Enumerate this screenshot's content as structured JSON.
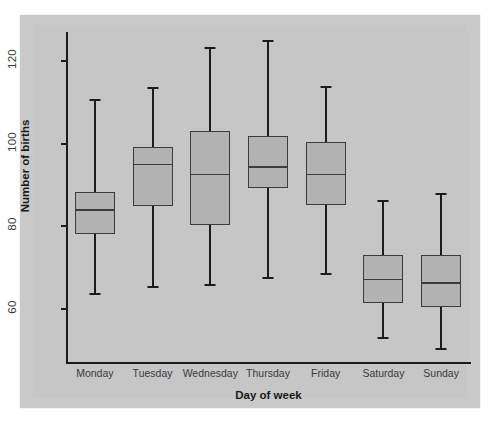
{
  "chart_data": {
    "type": "box",
    "title": "",
    "xlabel": "Day of week",
    "ylabel": "Number of births",
    "categories": [
      "Monday",
      "Tuesday",
      "Wednesday",
      "Thursday",
      "Friday",
      "Saturday",
      "Sunday"
    ],
    "yticks": [
      60,
      80,
      100,
      120
    ],
    "ytick_labels": [
      "60",
      "80",
      "100",
      "120"
    ],
    "ylim": [
      47,
      127
    ],
    "grid": false,
    "legend": null,
    "box_fill_color": "#b2b2b2",
    "line_color": "#3c3c3c",
    "panel_color": "#c6c6c6",
    "boxes": [
      {
        "category": "Monday",
        "whisker_low": 63.5,
        "q1": 78.1,
        "median": 84.2,
        "q3": 88.4,
        "whisker_high": 110.7
      },
      {
        "category": "Tuesday",
        "whisker_low": 65.2,
        "q1": 85.0,
        "median": 95.2,
        "q3": 99.3,
        "whisker_high": 113.6
      },
      {
        "category": "Wednesday",
        "whisker_low": 65.7,
        "q1": 80.4,
        "median": 92.8,
        "q3": 103.0,
        "whisker_high": 123.4
      },
      {
        "category": "Thursday",
        "whisker_low": 67.4,
        "q1": 89.4,
        "median": 94.5,
        "q3": 101.8,
        "whisker_high": 125.1
      },
      {
        "category": "Friday",
        "whisker_low": 68.2,
        "q1": 85.3,
        "median": 92.8,
        "q3": 100.3,
        "whisker_high": 113.9
      },
      {
        "category": "Saturday",
        "whisker_low": 52.9,
        "q1": 61.4,
        "median": 67.4,
        "q3": 73.0,
        "whisker_high": 86.4
      },
      {
        "category": "Sunday",
        "whisker_low": 50.2,
        "q1": 60.6,
        "median": 66.5,
        "q3": 73.0,
        "whisker_high": 88.1
      }
    ]
  }
}
